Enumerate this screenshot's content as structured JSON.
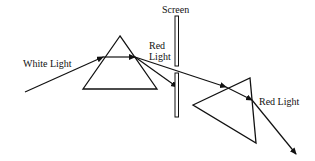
{
  "diagram": {
    "type": "optics",
    "labels": {
      "white_light": "White Light",
      "red_light_1_line1": "Red",
      "red_light_1_line2": "Light",
      "screen": "Screen",
      "red_light_2": "Red Light"
    },
    "colors": {
      "stroke": "#111111",
      "background": "#ffffff"
    }
  }
}
